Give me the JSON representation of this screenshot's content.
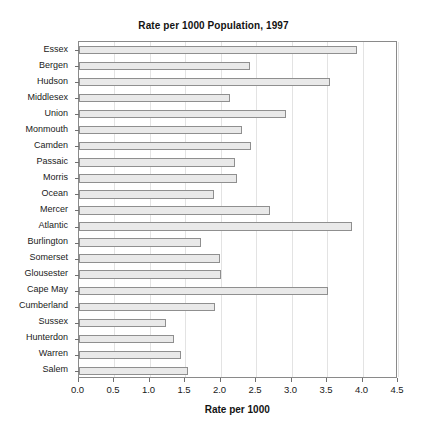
{
  "chart_data": {
    "type": "bar",
    "orientation": "horizontal",
    "title": "Rate per 1000 Population, 1997",
    "xlabel": "Rate per 1000",
    "ylabel": "",
    "xlim": [
      0.0,
      4.5
    ],
    "xticks": [
      "0.0",
      "0.5",
      "1.0",
      "1.5",
      "2.0",
      "2.5",
      "3.0",
      "3.5",
      "4.0",
      "4.5"
    ],
    "xtick_values": [
      0.0,
      0.5,
      1.0,
      1.5,
      2.0,
      2.5,
      3.0,
      3.5,
      4.0,
      4.5
    ],
    "grid": true,
    "legend": null,
    "categories": [
      "Essex",
      "Bergen",
      "Hudson",
      "Middlesex",
      "Union",
      "Monmouth",
      "Camden",
      "Passaic",
      "Morris",
      "Ocean",
      "Mercer",
      "Atlantic",
      "Burlington",
      "Somerset",
      "Glousester",
      "Cape May",
      "Cumberland",
      "Sussex",
      "Hunterdon",
      "Warren",
      "Salem"
    ],
    "values": [
      3.92,
      2.42,
      3.54,
      2.13,
      2.92,
      2.3,
      2.43,
      2.2,
      2.23,
      1.91,
      2.7,
      3.85,
      1.73,
      1.99,
      2.0,
      3.51,
      1.92,
      1.23,
      1.34,
      1.44,
      1.54
    ],
    "colors": {
      "bar_fill": "#e9e9e9",
      "bar_border": "#8f8f8f",
      "grid": "#e3e3e3",
      "axis": "#8a8a8a",
      "text": "#1a1a1a"
    }
  }
}
